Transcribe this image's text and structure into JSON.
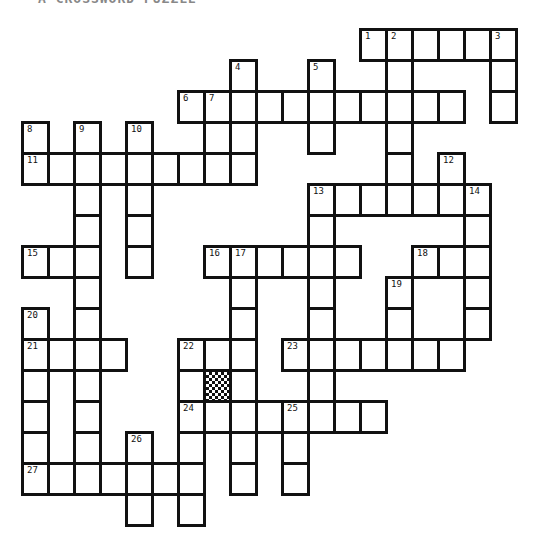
{
  "title": "A CROSSWORD PUZZLE",
  "grid": {
    "origin_x": 22,
    "origin_y": 29,
    "cell_w": 26,
    "cell_h": 31,
    "rows": [
      {
        "r": 0,
        "cols": [
          13,
          14,
          15,
          16,
          17,
          18
        ]
      },
      {
        "r": 1,
        "cols": [
          8,
          11,
          14,
          18
        ]
      },
      {
        "r": 2,
        "cols": [
          6,
          7,
          8,
          9,
          10,
          11,
          12,
          13,
          14,
          15,
          16,
          18
        ]
      },
      {
        "r": 3,
        "cols": [
          0,
          2,
          4,
          7,
          8,
          11,
          14
        ]
      },
      {
        "r": 4,
        "cols": [
          0,
          1,
          2,
          3,
          4,
          5,
          6,
          7,
          8,
          14,
          16
        ]
      },
      {
        "r": 5,
        "cols": [
          2,
          4,
          11,
          12,
          13,
          14,
          15,
          16,
          17
        ]
      },
      {
        "r": 6,
        "cols": [
          2,
          4,
          11,
          17
        ]
      },
      {
        "r": 7,
        "cols": [
          0,
          1,
          2,
          4,
          7,
          8,
          9,
          10,
          11,
          12,
          15,
          16,
          17
        ]
      },
      {
        "r": 8,
        "cols": [
          2,
          8,
          11,
          14,
          17
        ]
      },
      {
        "r": 9,
        "cols": [
          0,
          2,
          8,
          11,
          14,
          17
        ]
      },
      {
        "r": 10,
        "cols": [
          0,
          1,
          2,
          3,
          6,
          7,
          8,
          10,
          11,
          12,
          13,
          14,
          15,
          16
        ]
      },
      {
        "r": 11,
        "cols": [
          0,
          2,
          6,
          7,
          8,
          11
        ]
      },
      {
        "r": 12,
        "cols": [
          0,
          2,
          6,
          7,
          8,
          9,
          10,
          11,
          12,
          13
        ]
      },
      {
        "r": 13,
        "cols": [
          0,
          2,
          4,
          6,
          8,
          10
        ]
      },
      {
        "r": 14,
        "cols": [
          0,
          1,
          2,
          3,
          4,
          5,
          6,
          8,
          10
        ]
      },
      {
        "r": 15,
        "cols": [
          4,
          6
        ]
      }
    ],
    "shaded": [
      {
        "r": 11,
        "c": 7
      }
    ],
    "numbers": [
      {
        "n": "1",
        "r": 0,
        "c": 13
      },
      {
        "n": "2",
        "r": 0,
        "c": 14
      },
      {
        "n": "3",
        "r": 0,
        "c": 18
      },
      {
        "n": "4",
        "r": 1,
        "c": 8
      },
      {
        "n": "5",
        "r": 1,
        "c": 11
      },
      {
        "n": "6",
        "r": 2,
        "c": 6
      },
      {
        "n": "7",
        "r": 2,
        "c": 7
      },
      {
        "n": "8",
        "r": 3,
        "c": 0
      },
      {
        "n": "9",
        "r": 3,
        "c": 2
      },
      {
        "n": "10",
        "r": 3,
        "c": 4
      },
      {
        "n": "11",
        "r": 4,
        "c": 0
      },
      {
        "n": "12",
        "r": 4,
        "c": 16
      },
      {
        "n": "13",
        "r": 5,
        "c": 11
      },
      {
        "n": "14",
        "r": 5,
        "c": 17
      },
      {
        "n": "15",
        "r": 7,
        "c": 0
      },
      {
        "n": "16",
        "r": 7,
        "c": 7
      },
      {
        "n": "17",
        "r": 7,
        "c": 8
      },
      {
        "n": "18",
        "r": 7,
        "c": 15
      },
      {
        "n": "19",
        "r": 8,
        "c": 14
      },
      {
        "n": "20",
        "r": 9,
        "c": 0
      },
      {
        "n": "21",
        "r": 10,
        "c": 0
      },
      {
        "n": "22",
        "r": 10,
        "c": 6
      },
      {
        "n": "23",
        "r": 10,
        "c": 10
      },
      {
        "n": "24",
        "r": 12,
        "c": 6
      },
      {
        "n": "25",
        "r": 12,
        "c": 10
      },
      {
        "n": "26",
        "r": 13,
        "c": 4
      },
      {
        "n": "27",
        "r": 14,
        "c": 0
      }
    ]
  }
}
